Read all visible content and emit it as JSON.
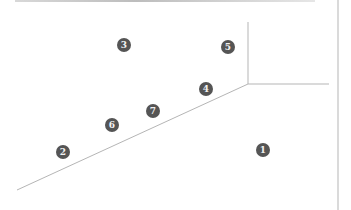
{
  "diagram": {
    "line_color": "#b5b5b5",
    "marker_color": "#555555",
    "lines": [
      {
        "id": "diagonal",
        "x1": 17,
        "y1": 190,
        "x2": 248,
        "y2": 84
      },
      {
        "id": "vertical-inner",
        "x1": 248,
        "y1": 22,
        "x2": 248,
        "y2": 84
      },
      {
        "id": "horizontal",
        "x1": 248,
        "y1": 84,
        "x2": 329,
        "y2": 84
      },
      {
        "id": "vertical-right",
        "x1": 338,
        "y1": 0,
        "x2": 338,
        "y2": 210
      }
    ],
    "markers": [
      {
        "label": "1",
        "x": 263,
        "y": 150
      },
      {
        "label": "2",
        "x": 63,
        "y": 152
      },
      {
        "label": "3",
        "x": 124,
        "y": 45
      },
      {
        "label": "4",
        "x": 206,
        "y": 89
      },
      {
        "label": "5",
        "x": 228,
        "y": 47
      },
      {
        "label": "6",
        "x": 112,
        "y": 125
      },
      {
        "label": "7",
        "x": 153,
        "y": 111
      }
    ]
  }
}
